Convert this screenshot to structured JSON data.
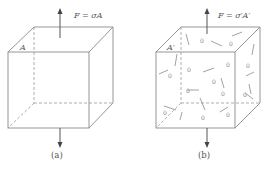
{
  "figure": {
    "panel_a": {
      "caption": "(a)",
      "force_label": "F = σA",
      "area_label": "A",
      "description": "Undamaged cube under uniaxial tension"
    },
    "panel_b": {
      "caption": "(b)",
      "force_label": "F = σ′A′",
      "area_label": "A′",
      "description": "Damaged cube with micro-cracks and voids under uniaxial tension",
      "void_symbol": "0"
    }
  }
}
